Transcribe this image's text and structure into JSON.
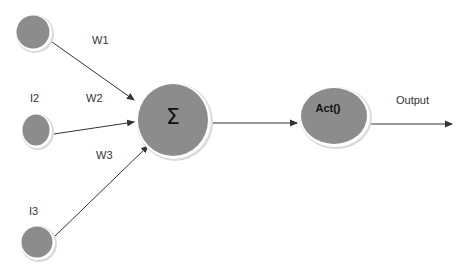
{
  "diagram": {
    "title": "",
    "colors": {
      "node_fill": "#8c8c8c",
      "node_ring": "#ffffff",
      "node_shadow": "#cfcfcf",
      "edge": "#333333",
      "text": "#333333"
    },
    "inputs": [
      {
        "id": "input-1",
        "label": ""
      },
      {
        "id": "input-2",
        "label": "I2"
      },
      {
        "id": "input-3",
        "label": "I3"
      }
    ],
    "weights": [
      {
        "id": "w1",
        "label": "W1"
      },
      {
        "id": "w2",
        "label": "W2"
      },
      {
        "id": "w3",
        "label": "W3"
      }
    ],
    "summation": {
      "label": "Σ"
    },
    "activation": {
      "label": "Act()"
    },
    "output": {
      "label": "Output"
    },
    "edges": [
      {
        "from": "input-1",
        "to": "summation",
        "weight": "W1"
      },
      {
        "from": "input-2",
        "to": "summation",
        "weight": "W2"
      },
      {
        "from": "input-3",
        "to": "summation",
        "weight": "W3"
      },
      {
        "from": "summation",
        "to": "activation"
      },
      {
        "from": "activation",
        "to": "output"
      }
    ]
  }
}
